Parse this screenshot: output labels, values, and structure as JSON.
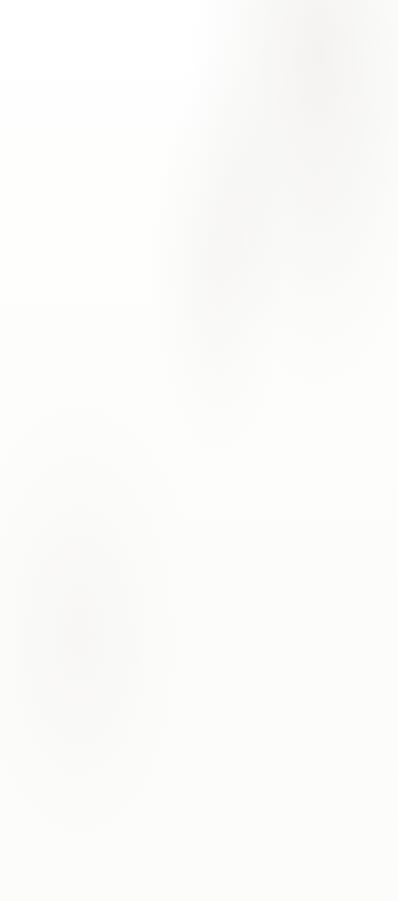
{
  "page": {
    "number": "52",
    "copyright": "© Lumos Information Services 2018 | LumosLearning.com"
  },
  "options": [
    {
      "letter": "A",
      "name": "option-a",
      "top": 15,
      "height": 198,
      "chart_data": {
        "type": "line",
        "title": "",
        "xlabel": "",
        "ylabel": "",
        "xlim": [
          -32,
          32
        ],
        "ylim": [
          -32,
          32
        ],
        "grid": true,
        "grid_step": 10,
        "xticks": [
          -20,
          0,
          20
        ],
        "yticks": [
          -20,
          20
        ],
        "xtick_labels": [
          "-20",
          "0",
          "20"
        ],
        "ytick_labels": [
          "-20",
          "20"
        ],
        "legend": "none",
        "series": [
          {
            "name": "line-1",
            "slope": 1.0,
            "intercept": 14,
            "x": [
              -32,
              32
            ],
            "y": [
              -18,
              46
            ]
          },
          {
            "name": "line-2",
            "slope": 1.0,
            "intercept": 2,
            "x": [
              -32,
              32
            ],
            "y": [
              -30,
              34
            ]
          }
        ]
      }
    },
    {
      "letter": "B",
      "name": "option-b",
      "top": 228,
      "height": 186,
      "chart_data": {
        "type": "line",
        "title": "",
        "xlabel": "",
        "ylabel": "",
        "xlim": [
          -32,
          32
        ],
        "ylim": [
          -32,
          32
        ],
        "grid": true,
        "grid_step": 10,
        "xticks": [
          -20,
          0,
          20
        ],
        "yticks": [
          -20,
          20
        ],
        "xtick_labels": [
          "-20",
          "0",
          "20"
        ],
        "ytick_labels": [
          "-20",
          "20"
        ],
        "legend": "none",
        "series": [
          {
            "name": "line-1",
            "slope": -0.62,
            "intercept": 10,
            "x": [
              -32,
              32
            ],
            "y": [
              29.8,
              -9.8
            ]
          },
          {
            "name": "line-2",
            "slope": 2.5,
            "intercept": 10,
            "x": [
              -16,
              10
            ],
            "y": [
              -30,
              35
            ]
          }
        ]
      }
    },
    {
      "letter": "C",
      "name": "option-c",
      "top": 431,
      "height": 192,
      "chart_data": {
        "type": "line",
        "title": "",
        "xlabel": "",
        "ylabel": "",
        "xlim": [
          -32,
          32
        ],
        "ylim": [
          -32,
          32
        ],
        "grid": true,
        "grid_step": 10,
        "xticks": [
          -20,
          0,
          20
        ],
        "yticks": [
          -20,
          20
        ],
        "xtick_labels": [
          "-20",
          "0",
          "20"
        ],
        "ytick_labels": [
          "-20",
          "20"
        ],
        "legend": "none",
        "series": [
          {
            "name": "line-1",
            "slope": 2.9,
            "intercept": 9,
            "x": [
              -14,
              8
            ],
            "y": [
              -32,
              32
            ]
          }
        ]
      }
    },
    {
      "letter": "D",
      "name": "option-d",
      "top": 637,
      "height": 190,
      "chart_data": {
        "type": "line",
        "title": "",
        "xlabel": "",
        "ylabel": "",
        "xlim": [
          -32,
          32
        ],
        "ylim": [
          -32,
          32
        ],
        "grid": true,
        "grid_step": 10,
        "xticks": [
          -20,
          0,
          20
        ],
        "yticks": [
          -20,
          20
        ],
        "xtick_labels": [
          "-20",
          "0",
          "20"
        ],
        "ytick_labels": [
          "-20",
          "20"
        ],
        "legend": "none",
        "series": [
          {
            "name": "line-1",
            "slope": 0.92,
            "intercept": 8,
            "x": [
              -28,
              30
            ],
            "y": [
              -18,
              36
            ]
          },
          {
            "name": "line-2",
            "slope": 17,
            "intercept": 9,
            "x": [
              -2.4,
              1.4
            ],
            "y": [
              -32,
              33
            ]
          }
        ]
      }
    }
  ],
  "colors": {
    "plot_border": "#5d5d5d",
    "axis": "#6a6a6a",
    "grid": "#d9dde6",
    "line": "#1f1f1f",
    "flag_fill": "#8e8e8e",
    "flag_text": "#ffffff",
    "footer_text": "#4a4a4a"
  }
}
